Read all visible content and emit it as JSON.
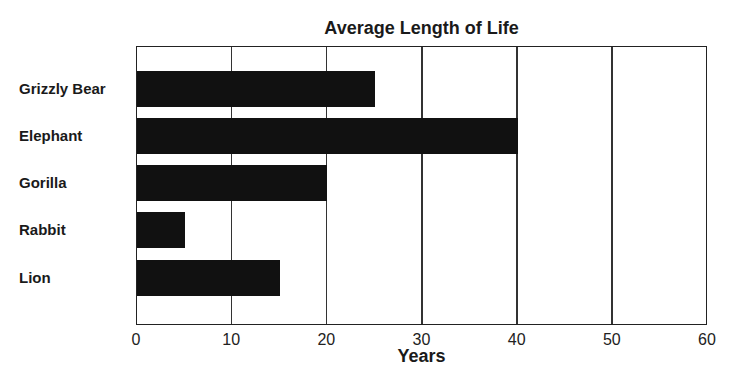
{
  "chart_data": {
    "type": "bar",
    "orientation": "horizontal",
    "title": "Average Length of Life",
    "xlabel": "Years",
    "ylabel": "",
    "categories": [
      "Grizzly Bear",
      "Elephant",
      "Gorilla",
      "Rabbit",
      "Lion"
    ],
    "values": [
      25,
      40,
      20,
      5,
      15
    ],
    "xlim": [
      0,
      60
    ],
    "xticks": [
      "0",
      "10",
      "20",
      "30",
      "40",
      "50",
      "60"
    ],
    "grid": true,
    "bar_color": "#111111"
  }
}
